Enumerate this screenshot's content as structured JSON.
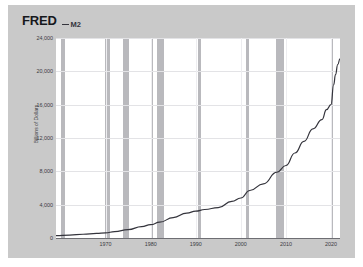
{
  "header": {
    "logo": "FRED",
    "legend_label": "M2",
    "legend_icon": "line-swatch-icon"
  },
  "axes": {
    "y_title": "Billions of Dollars",
    "y_ticks": [
      "24,000",
      "20,000",
      "16,000",
      "12,000",
      "8,000",
      "4,000",
      "0"
    ],
    "x_ticks": [
      "1970",
      "1980",
      "1990",
      "2000",
      "2010",
      "2020"
    ]
  },
  "colors": {
    "panel_background": "#c9c9c9",
    "plot_background": "#ffffff",
    "series_line": "#34343c",
    "recession_band": "#b9b9bd",
    "gridline": "#e3e3e6",
    "axis_text": "#3a3a3f"
  },
  "chart_data": {
    "type": "line",
    "title": "FRED",
    "xlabel": "",
    "ylabel": "Billions of Dollars",
    "xlim": [
      1959,
      2022
    ],
    "ylim": [
      0,
      24000
    ],
    "grid": true,
    "legend_position": "top-left",
    "series": [
      {
        "name": "M2",
        "x": [
          1959,
          1962,
          1965,
          1968,
          1970,
          1972,
          1975,
          1978,
          1980,
          1982,
          1985,
          1988,
          1990,
          1992,
          1995,
          1998,
          2000,
          2002,
          2005,
          2008,
          2010,
          2012,
          2014,
          2016,
          2018,
          2019,
          2020,
          2020.6,
          2021,
          2021.5,
          2022
        ],
        "values": [
          290,
          350,
          450,
          560,
          620,
          760,
          1000,
          1370,
          1600,
          1900,
          2450,
          2990,
          3220,
          3420,
          3650,
          4400,
          4800,
          5700,
          6500,
          7900,
          8700,
          10200,
          11600,
          13100,
          14200,
          15400,
          16000,
          18400,
          19600,
          20800,
          21500
        ]
      }
    ],
    "recession_bands": [
      {
        "start": 1960.2,
        "end": 1961.1
      },
      {
        "start": 1969.9,
        "end": 1970.9
      },
      {
        "start": 1973.9,
        "end": 1975.2
      },
      {
        "start": 1980.1,
        "end": 1980.6
      },
      {
        "start": 1981.5,
        "end": 1982.9
      },
      {
        "start": 1990.6,
        "end": 1991.2
      },
      {
        "start": 2001.2,
        "end": 2001.9
      },
      {
        "start": 2007.9,
        "end": 2009.5
      },
      {
        "start": 2020.1,
        "end": 2020.4
      }
    ]
  }
}
